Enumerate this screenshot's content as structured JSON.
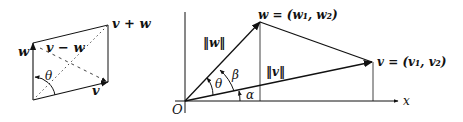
{
  "left_figure": {
    "labels": {
      "w": "w",
      "v": "v",
      "v_plus_w": "v + w",
      "v_minus_w": "v − w",
      "theta": "θ"
    }
  },
  "right_figure": {
    "labels": {
      "origin": "O",
      "x_axis": "x",
      "w_point": "w = (w₁, w₂)",
      "v_point": "v = (v₁, v₂)",
      "norm_w": "‖w‖",
      "norm_v": "‖v‖",
      "theta": "θ",
      "beta": "β",
      "alpha": "α"
    }
  },
  "colors": {
    "line": "#111111",
    "dotted": "#444444",
    "background": "#ffffff"
  }
}
